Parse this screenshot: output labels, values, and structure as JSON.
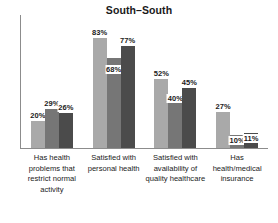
{
  "chart_data": {
    "type": "bar",
    "title": "South–South",
    "xlabel": "",
    "ylabel": "",
    "ylim": [
      0,
      100
    ],
    "grid": false,
    "legend": "none",
    "axis": {
      "y_axis_visible": true,
      "x_axis_visible": true,
      "tick_labels_visible": false
    },
    "categories": [
      "Has health problems that restrict normal activity",
      "Satisfied with personal health",
      "Satisfied with availability of quality healthcare",
      "Has health/medical insurance"
    ],
    "series": [
      {
        "name": "Series 1",
        "color": "#a9a9a9",
        "values": [
          20,
          83,
          52,
          27
        ]
      },
      {
        "name": "Series 2",
        "color": "#767676",
        "values": [
          29,
          68,
          40,
          10
        ]
      },
      {
        "name": "Series 3",
        "color": "#4b4b4b",
        "values": [
          26,
          77,
          45,
          11
        ]
      }
    ],
    "value_labels": [
      [
        "20%",
        "29%",
        "26%"
      ],
      [
        "83%",
        "68%",
        "77%"
      ],
      [
        "52%",
        "40%",
        "45%"
      ],
      [
        "27%",
        "10%",
        "11%"
      ]
    ],
    "value_label_offsets": [
      [
        0,
        0,
        0
      ],
      [
        0,
        -17,
        0
      ],
      [
        0,
        -9,
        0
      ],
      [
        0,
        -11,
        -11
      ]
    ]
  }
}
